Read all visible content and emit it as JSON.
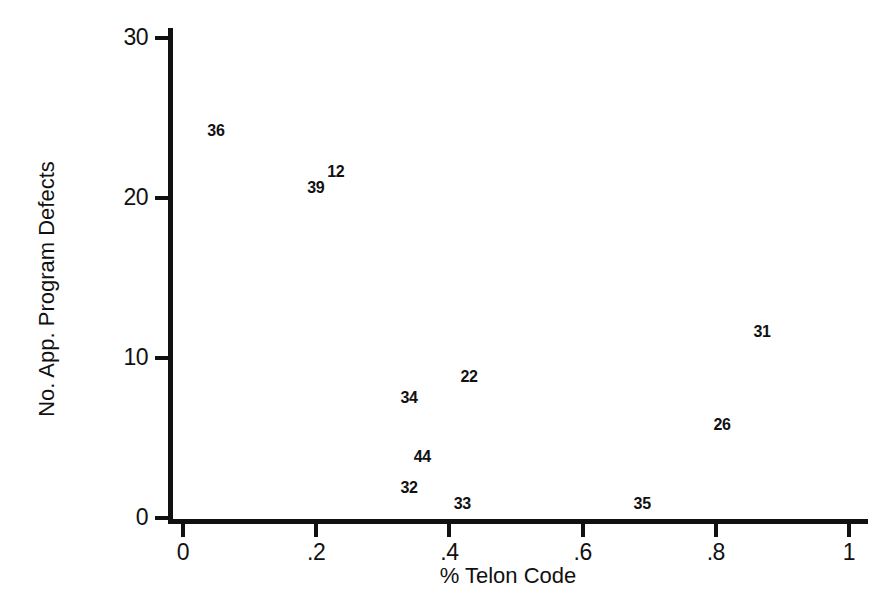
{
  "chart_data": {
    "type": "scatter",
    "title": "",
    "xlabel": "% Telon Code",
    "ylabel": "No. App. Program Defects",
    "xlim": [
      0,
      1
    ],
    "ylim": [
      0,
      30
    ],
    "grid": false,
    "legend": "none",
    "marker_style": "text-label-only",
    "xticks": [
      {
        "value": 0,
        "label": "0"
      },
      {
        "value": 0.2,
        "label": ".2"
      },
      {
        "value": 0.4,
        "label": ".4"
      },
      {
        "value": 0.6,
        "label": ".6"
      },
      {
        "value": 0.8,
        "label": ".8"
      },
      {
        "value": 1,
        "label": "1"
      }
    ],
    "yticks": [
      {
        "value": 0,
        "label": "0"
      },
      {
        "value": 10,
        "label": "10"
      },
      {
        "value": 20,
        "label": "20"
      },
      {
        "value": 30,
        "label": "30"
      }
    ],
    "points": [
      {
        "label": "36",
        "x": 0.05,
        "y": 24.2
      },
      {
        "label": "12",
        "x": 0.23,
        "y": 21.6
      },
      {
        "label": "39",
        "x": 0.2,
        "y": 20.6
      },
      {
        "label": "31",
        "x": 0.87,
        "y": 11.6
      },
      {
        "label": "22",
        "x": 0.43,
        "y": 8.8
      },
      {
        "label": "34",
        "x": 0.34,
        "y": 7.5
      },
      {
        "label": "26",
        "x": 0.81,
        "y": 5.8
      },
      {
        "label": "44",
        "x": 0.36,
        "y": 3.8
      },
      {
        "label": "32",
        "x": 0.34,
        "y": 1.9
      },
      {
        "label": "33",
        "x": 0.42,
        "y": 0.9
      },
      {
        "label": "35",
        "x": 0.69,
        "y": 0.9
      }
    ]
  },
  "axes": {
    "x_title": "% Telon Code",
    "y_title": "No. App. Program Defects"
  },
  "geometry": {
    "x_px_at_0": 183,
    "x_px_at_1": 849,
    "y_px_at_0": 518,
    "y_px_at_30": 38
  }
}
